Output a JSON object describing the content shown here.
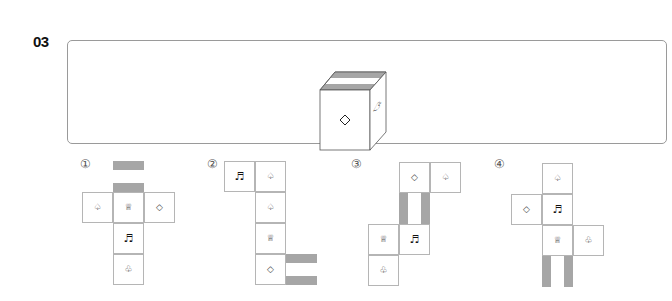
{
  "question": {
    "number": "03",
    "cube_faces": {
      "front": "◇",
      "right": "♤",
      "top": "gray-stripes"
    }
  },
  "options": [
    {
      "label": "①",
      "cells": [
        {
          "symbol": "",
          "stripes": "horizontal"
        },
        {
          "symbol": "♤"
        },
        {
          "symbol": "♕"
        },
        {
          "symbol": "◇"
        },
        {
          "symbol": "♬"
        },
        {
          "symbol": "♧"
        }
      ]
    },
    {
      "label": "②",
      "cells": [
        {
          "symbol": "♬"
        },
        {
          "symbol": "♤"
        },
        {
          "symbol": "♤"
        },
        {
          "symbol": "♕"
        },
        {
          "symbol": "◇"
        },
        {
          "symbol": "",
          "stripes": "horizontal"
        }
      ]
    },
    {
      "label": "③",
      "cells": [
        {
          "symbol": "◇"
        },
        {
          "symbol": "♤"
        },
        {
          "symbol": "",
          "stripes": "vertical"
        },
        {
          "symbol": "♕"
        },
        {
          "symbol": "♬"
        },
        {
          "symbol": "♧"
        }
      ]
    },
    {
      "label": "④",
      "cells": [
        {
          "symbol": "♤"
        },
        {
          "symbol": "◇"
        },
        {
          "symbol": "♬"
        },
        {
          "symbol": "♕"
        },
        {
          "symbol": "♧"
        },
        {
          "symbol": "",
          "stripes": "vertical"
        }
      ]
    }
  ]
}
